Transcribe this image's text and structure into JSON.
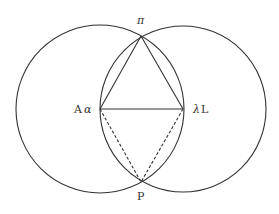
{
  "diagram": {
    "type": "geometric-construction",
    "colors": {
      "stroke": "#333333",
      "background": "#ffffff"
    },
    "circles": [
      {
        "name": "left-circle",
        "cx": 100,
        "cy": 109,
        "r": 84
      },
      {
        "name": "right-circle",
        "cx": 183,
        "cy": 109,
        "r": 83
      }
    ],
    "points": {
      "top": {
        "label": "π",
        "x": 141,
        "y": 36
      },
      "bottom": {
        "label": "P",
        "x": 141,
        "y": 182
      },
      "left": {
        "label_upright": "A",
        "label_italic": "α",
        "x": 100,
        "y": 109
      },
      "right": {
        "label_italic": "λ",
        "label_upright": "L",
        "x": 183,
        "y": 109
      }
    },
    "segments_solid": [
      [
        "left",
        "right"
      ],
      [
        "left",
        "top"
      ],
      [
        "right",
        "top"
      ]
    ],
    "segments_dashed": [
      [
        "left",
        "bottom"
      ],
      [
        "right",
        "bottom"
      ]
    ]
  }
}
